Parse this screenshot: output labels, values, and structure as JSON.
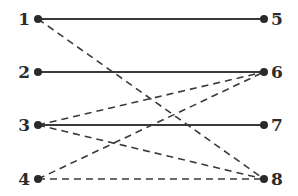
{
  "diagram": {
    "type": "bipartite-graph",
    "left_nodes": [
      {
        "id": "1",
        "label": "1",
        "x": 38,
        "y": 19
      },
      {
        "id": "2",
        "label": "2",
        "x": 38,
        "y": 72
      },
      {
        "id": "3",
        "label": "3",
        "x": 38,
        "y": 125
      },
      {
        "id": "4",
        "label": "4",
        "x": 38,
        "y": 179
      }
    ],
    "right_nodes": [
      {
        "id": "5",
        "label": "5",
        "x": 264,
        "y": 19
      },
      {
        "id": "6",
        "label": "6",
        "x": 264,
        "y": 72
      },
      {
        "id": "7",
        "label": "7",
        "x": 264,
        "y": 125
      },
      {
        "id": "8",
        "label": "8",
        "x": 264,
        "y": 179
      }
    ],
    "edges": [
      {
        "from": "1",
        "to": "5",
        "style": "solid"
      },
      {
        "from": "2",
        "to": "6",
        "style": "solid"
      },
      {
        "from": "3",
        "to": "7",
        "style": "solid"
      },
      {
        "from": "1",
        "to": "8",
        "style": "dashed"
      },
      {
        "from": "3",
        "to": "6",
        "style": "dashed"
      },
      {
        "from": "3",
        "to": "8",
        "style": "dashed"
      },
      {
        "from": "4",
        "to": "6",
        "style": "dashed"
      },
      {
        "from": "4",
        "to": "8",
        "style": "dashed"
      }
    ],
    "colors": {
      "line": "#3a3a3a",
      "node": "#2a2a2a",
      "label": "#2b2b2b"
    }
  }
}
